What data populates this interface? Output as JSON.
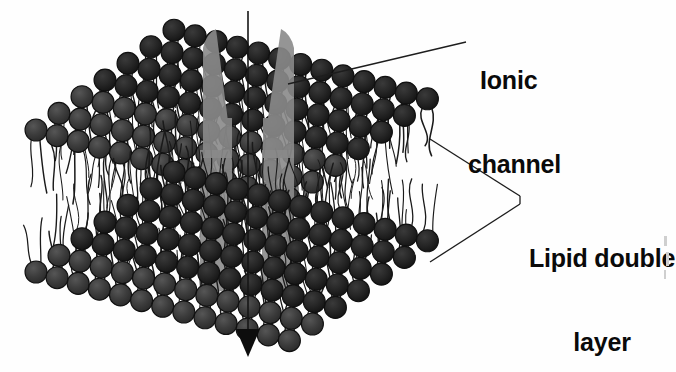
{
  "figure": {
    "type": "biology-schematic-diagram",
    "background_color": "#ffffff"
  },
  "labels": {
    "ionic_channel": {
      "line1": "Ionic",
      "line2": "channel",
      "color": "#0a0a0a",
      "leader": "single-line"
    },
    "lipid_double_layer": {
      "line1": "Lipid double",
      "line2": "layer",
      "color": "#0a0a0a",
      "leader": "two-line-fork"
    }
  },
  "elements": {
    "lipid_head": {
      "name": "lipid-head-sphere",
      "shape": "circle",
      "fill": "#3a3a3a",
      "stroke": "#111111"
    },
    "lipid_tail": {
      "name": "lipid-tail-chain",
      "shape": "wavy-line",
      "stroke": "#1a1a1a"
    },
    "channel_protein": {
      "name": "ionic-channel-protein",
      "shape": "two-tapered-subunits",
      "fill": "#8a8a8a",
      "opacity": 0.88
    },
    "ion_flow_arrow": {
      "name": "ion-flow-arrow",
      "direction": "downward",
      "color": "#111111"
    }
  },
  "colors": {
    "head_dark": "#3a3a3a",
    "head_darker": "#2c2c2c",
    "head_shadow": "#1c1c1c",
    "outline": "#101010",
    "channel_gray": "#8a8a8a",
    "channel_gray_dark": "#7b7b7b",
    "tail_stroke": "#1a1a1a",
    "leader_line": "#1d1d1d",
    "text": "#0a0a0a",
    "background": "#ffffff"
  },
  "geometry": {
    "upper_leaflet_rows": 7,
    "upper_leaflet_cols": 13,
    "lower_leaflet_rows": 7,
    "lower_leaflet_cols": 13,
    "perspective_dx": 23,
    "perspective_dy": 13,
    "sphere_radius": 11
  }
}
